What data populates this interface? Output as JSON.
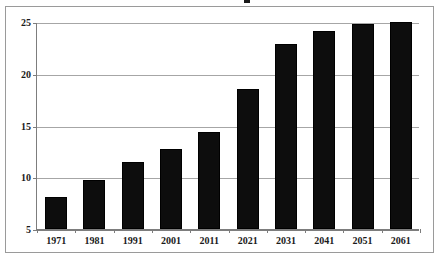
{
  "chart_data": {
    "type": "bar",
    "title": "",
    "xlabel": "",
    "ylabel": "",
    "categories": [
      "1971",
      "1981",
      "1991",
      "2001",
      "2011",
      "2021",
      "2031",
      "2041",
      "2051",
      "2061"
    ],
    "values": [
      8.1,
      9.7,
      11.5,
      12.7,
      14.4,
      18.5,
      22.9,
      24.1,
      24.8,
      25.0
    ],
    "series": [
      {
        "name": "",
        "values": [
          8.1,
          9.7,
          11.5,
          12.7,
          14.4,
          18.5,
          22.9,
          24.1,
          24.8,
          25.0
        ]
      }
    ],
    "ylim": [
      5,
      25
    ],
    "yticks": [
      5,
      10,
      15,
      20,
      25
    ],
    "ytick_labels": [
      "5",
      "10",
      "15",
      "20",
      "25"
    ],
    "xtick_labels": [
      "1971",
      "1981",
      "1991",
      "2001",
      "2011",
      "2021",
      "2031",
      "2041",
      "2051",
      "2061"
    ],
    "grid": true,
    "grid_axis": "y",
    "legend": false,
    "legend_position": "none",
    "bar_color": "#0d0d0d",
    "gridline_color": "#a6a6a6",
    "axis_color": "#7d7d7d",
    "frame_color": "#9a9a9a",
    "background": "#ffffff",
    "annotations": []
  },
  "frame": {
    "title_fragment": ""
  }
}
